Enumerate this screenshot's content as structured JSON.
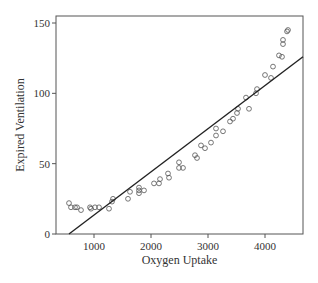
{
  "chart_data": {
    "type": "scatter",
    "title": "",
    "xlabel": "Oxygen Uptake",
    "ylabel": "Expired Ventilation",
    "xlim": [
      350,
      4700
    ],
    "ylim": [
      0,
      155
    ],
    "xticks": [
      1000,
      2000,
      3000,
      4000
    ],
    "yticks": [
      0,
      50,
      100,
      150
    ],
    "grid": false,
    "legend": null,
    "series": [
      {
        "name": "observations",
        "marker": "open-circle",
        "points": [
          [
            561,
            22
          ],
          [
            596,
            19
          ],
          [
            667,
            19
          ],
          [
            702,
            19
          ],
          [
            772,
            17
          ],
          [
            930,
            19
          ],
          [
            947,
            18
          ],
          [
            1018,
            19
          ],
          [
            1088,
            19
          ],
          [
            1263,
            18
          ],
          [
            1316,
            23
          ],
          [
            1333,
            25
          ],
          [
            1596,
            25
          ],
          [
            1632,
            30
          ],
          [
            1789,
            29
          ],
          [
            1789,
            33
          ],
          [
            1789,
            31
          ],
          [
            1877,
            31
          ],
          [
            2053,
            36
          ],
          [
            2140,
            36
          ],
          [
            2158,
            39
          ],
          [
            2298,
            43
          ],
          [
            2316,
            40
          ],
          [
            2491,
            51
          ],
          [
            2491,
            47
          ],
          [
            2561,
            47
          ],
          [
            2772,
            56
          ],
          [
            2807,
            54
          ],
          [
            2877,
            63
          ],
          [
            2947,
            61
          ],
          [
            3053,
            65
          ],
          [
            3140,
            75
          ],
          [
            3140,
            70
          ],
          [
            3263,
            73
          ],
          [
            3386,
            80
          ],
          [
            3439,
            82
          ],
          [
            3509,
            86
          ],
          [
            3526,
            89
          ],
          [
            3667,
            97
          ],
          [
            3719,
            89
          ],
          [
            3842,
            100
          ],
          [
            3860,
            103
          ],
          [
            4000,
            113
          ],
          [
            4105,
            111
          ],
          [
            4140,
            119
          ],
          [
            4246,
            127
          ],
          [
            4298,
            126
          ],
          [
            4316,
            138
          ],
          [
            4316,
            135
          ],
          [
            4386,
            144
          ],
          [
            4404,
            145
          ]
        ]
      },
      {
        "name": "fitted line",
        "type": "line",
        "points": [
          [
            561,
            0
          ],
          [
            4667,
            126
          ]
        ]
      }
    ]
  },
  "plot": {
    "frame": {
      "left": 56,
      "top": 16,
      "right": 303,
      "bottom": 234
    },
    "colors": {
      "axis": "#555555",
      "point": "#555555",
      "line": "#222222",
      "text": "#333333"
    }
  }
}
